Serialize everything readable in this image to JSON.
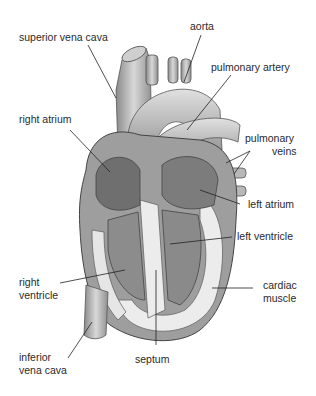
{
  "figure": {
    "labels": {
      "superior_vena_cava": "superior vena cava",
      "aorta": "aorta",
      "pulmonary_artery": "pulmonary artery",
      "right_atrium": "right atrium",
      "pulmonary_veins_1": "pulmonary",
      "pulmonary_veins_2": "veins",
      "left_atrium": "left atrium",
      "left_ventricle": "left ventricle",
      "right_ventricle_1": "right",
      "right_ventricle_2": "ventricle",
      "cardiac_muscle_1": "cardiac",
      "cardiac_muscle_2": "muscle",
      "inferior_vena_cava_1": "inferior",
      "inferior_vena_cava_2": "vena cava",
      "septum": "septum"
    },
    "colors": {
      "tissue_dark": "#6f6f6f",
      "tissue_mid": "#a3a3a3",
      "tissue_light": "#d2d2d2",
      "muscle": "#ececec",
      "leader_line": "#222222"
    }
  }
}
